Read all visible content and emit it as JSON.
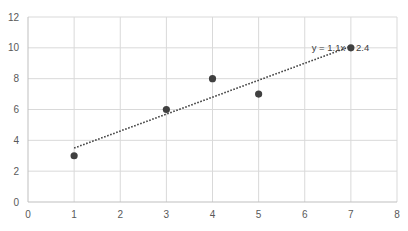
{
  "chart_data": {
    "type": "scatter",
    "title": "",
    "xlabel": "",
    "ylabel": "",
    "xlim": [
      0,
      8
    ],
    "ylim": [
      0,
      12
    ],
    "x_ticks": [
      0,
      1,
      2,
      3,
      4,
      5,
      6,
      7,
      8
    ],
    "y_ticks": [
      0,
      2,
      4,
      6,
      8,
      10,
      12
    ],
    "grid": true,
    "legend": null,
    "series": [
      {
        "name": "Series1",
        "x": [
          1,
          3,
          4,
          5,
          7
        ],
        "y": [
          3,
          6,
          8,
          7,
          10
        ],
        "marker_color": "#404040"
      }
    ],
    "trendline": {
      "type": "linear",
      "equation": "y = 1.1x + 2.4",
      "slope": 1.1,
      "intercept": 2.4,
      "x_range": [
        1,
        7
      ],
      "style": "dotted",
      "color": "#404040"
    },
    "annotations": [
      {
        "text": "y = 1.1x + 2.4",
        "x": 6.15,
        "y": 10
      }
    ]
  },
  "colors": {
    "grid": "#d9d9d9",
    "axis": "#bfbfbf",
    "tick_text": "#595959",
    "marker": "#404040"
  }
}
